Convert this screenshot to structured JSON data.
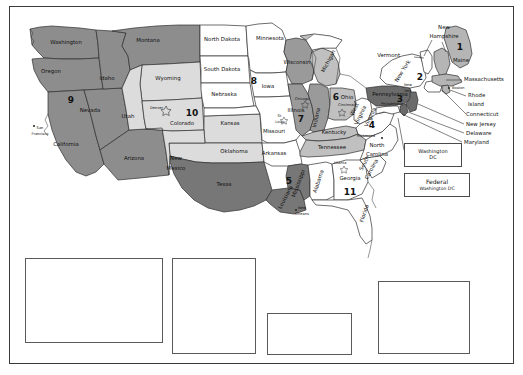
{
  "map": {
    "title": "United States Federal Judicial Circuits",
    "colors": {
      "dark_gray": "#6e6e6e",
      "mid_gray": "#a0a0a0",
      "light_gray": "#c9c9c9",
      "pale_gray": "#e2e2e2",
      "white": "#ffffff",
      "outline": "#2f2f2f",
      "frame": "#3a3a3a"
    },
    "circuit_numbers": [
      {
        "id": "circuit-1",
        "label": "1",
        "x": 460,
        "y": 47,
        "region": "Maine / Massachusetts / New Hampshire / Rhode Island / Puerto Rico"
      },
      {
        "id": "circuit-2",
        "label": "2",
        "x": 420,
        "y": 77,
        "region": "New York / Connecticut / Vermont"
      },
      {
        "id": "circuit-3",
        "label": "3",
        "x": 396,
        "y": 104,
        "region": "Pennsylvania / New Jersey / Delaware / Virgin Islands"
      },
      {
        "id": "circuit-4",
        "label": "4",
        "x": 371,
        "y": 126,
        "region": "Virginia / West Virginia / North Carolina / South Carolina / Maryland"
      },
      {
        "id": "circuit-5",
        "label": "5",
        "x": 277,
        "y": 184,
        "region": "Texas / Louisiana / Mississippi"
      },
      {
        "id": "circuit-6",
        "label": "6",
        "x": 331,
        "y": 98,
        "region": "Ohio / Michigan / Kentucky / Tennessee"
      },
      {
        "id": "circuit-7",
        "label": "7",
        "x": 297,
        "y": 120,
        "region": "Illinois / Indiana / Wisconsin"
      },
      {
        "id": "circuit-8",
        "label": "8",
        "x": 252,
        "y": 82,
        "region": "Minnesota / Iowa / Missouri / Arkansas / Nebraska / Dakotas"
      },
      {
        "id": "circuit-9",
        "label": "9",
        "x": 69,
        "y": 100,
        "region": "California / Nevada / Oregon / Washington / Idaho / Montana / Arizona / Alaska / Hawaii"
      },
      {
        "id": "circuit-10",
        "label": "10",
        "x": 190,
        "y": 113,
        "region": "Colorado / Wyoming / Utah / Kansas / Oklahoma / New Mexico"
      },
      {
        "id": "circuit-11",
        "label": "11",
        "x": 349,
        "y": 192,
        "region": "Georgia / Florida / Alabama"
      }
    ],
    "states": [
      {
        "name": "Washington",
        "x": 66,
        "y": 44
      },
      {
        "name": "Oregon",
        "x": 51,
        "y": 73
      },
      {
        "name": "Idaho",
        "x": 107,
        "y": 80
      },
      {
        "name": "Montana",
        "x": 148,
        "y": 42
      },
      {
        "name": "Wyoming",
        "x": 162,
        "y": 80
      },
      {
        "name": "Nevada",
        "x": 84,
        "y": 112
      },
      {
        "name": "Utah",
        "x": 128,
        "y": 118
      },
      {
        "name": "California",
        "x": 64,
        "y": 144
      },
      {
        "name": "Arizona",
        "x": 128,
        "y": 159
      },
      {
        "name": "New",
        "x": 176,
        "y": 160
      },
      {
        "name": "Mexico",
        "x": 176,
        "y": 170
      },
      {
        "name": "Colorado",
        "x": 188,
        "y": 125
      },
      {
        "name": "North Dakota",
        "x": 216,
        "y": 34
      },
      {
        "name": "South Dakota",
        "x": 216,
        "y": 70
      },
      {
        "name": "Nebraska",
        "x": 219,
        "y": 95
      },
      {
        "name": "Kansas",
        "x": 227,
        "y": 124
      },
      {
        "name": "Oklahoma",
        "x": 234,
        "y": 151
      },
      {
        "name": "Texas",
        "x": 224,
        "y": 185
      },
      {
        "name": "Minnesota",
        "x": 267,
        "y": 38
      },
      {
        "name": "Iowa",
        "x": 265,
        "y": 87
      },
      {
        "name": "Missouri",
        "x": 271,
        "y": 134
      },
      {
        "name": "Arkansas",
        "x": 272,
        "y": 154
      },
      {
        "name": "Wisconsin",
        "x": 294,
        "y": 62
      },
      {
        "name": "Illinois",
        "x": 294,
        "y": 110
      },
      {
        "name": "Indiana",
        "x": 318,
        "y": 115
      },
      {
        "name": "Ohio",
        "x": 343,
        "y": 98
      },
      {
        "name": "Michigan",
        "x": 328,
        "y": 62
      },
      {
        "name": "Kentucky",
        "x": 333,
        "y": 132
      },
      {
        "name": "Tennessee",
        "x": 331,
        "y": 147
      },
      {
        "name": "Mississippi",
        "x": 299,
        "y": 182
      },
      {
        "name": "Alabama",
        "x": 318,
        "y": 180
      },
      {
        "name": "Louisiana",
        "x": 285,
        "y": 194
      },
      {
        "name": "Georgia",
        "x": 349,
        "y": 178
      },
      {
        "name": "Florida",
        "x": 365,
        "y": 212
      },
      {
        "name": "South",
        "x": 363,
        "y": 163
      },
      {
        "name": "Carolina",
        "x": 363,
        "y": 171
      },
      {
        "name": "North",
        "x": 375,
        "y": 148
      },
      {
        "name": "Carolina",
        "x": 375,
        "y": 157
      },
      {
        "name": "Virginia",
        "x": 372,
        "y": 115
      },
      {
        "name": "West",
        "x": 356,
        "y": 110
      },
      {
        "name": "Virginia",
        "x": 356,
        "y": 117
      },
      {
        "name": "Pennsylvania",
        "x": 392,
        "y": 96
      },
      {
        "name": "New York",
        "x": 410,
        "y": 72
      },
      {
        "name": "Vermont",
        "x": 403,
        "y": 56
      },
      {
        "name": "New",
        "x": 448,
        "y": 28
      },
      {
        "name": "Hampshire",
        "x": 448,
        "y": 37
      },
      {
        "name": "Maine",
        "x": 463,
        "y": 62
      },
      {
        "name": "Massachusetts",
        "x": 478,
        "y": 78
      },
      {
        "name": "Rhode",
        "x": 477,
        "y": 95
      },
      {
        "name": "Island",
        "x": 477,
        "y": 104
      },
      {
        "name": "Connecticut",
        "x": 476,
        "y": 114
      },
      {
        "name": "New Jersey",
        "x": 474,
        "y": 124
      },
      {
        "name": "Delaware",
        "x": 473,
        "y": 133
      },
      {
        "name": "Maryland",
        "x": 471,
        "y": 142
      }
    ],
    "cities": [
      {
        "name": "Denver",
        "x": 165,
        "y": 108
      },
      {
        "name": "San",
        "x": 34,
        "y": 128
      },
      {
        "name": "Francisco",
        "x": 34,
        "y": 134
      },
      {
        "name": "St.",
        "x": 278,
        "y": 116
      },
      {
        "name": "Louis",
        "x": 278,
        "y": 122
      },
      {
        "name": "Chicago",
        "x": 300,
        "y": 99
      },
      {
        "name": "Cincinnati",
        "x": 344,
        "y": 105
      },
      {
        "name": "Richmond",
        "x": 364,
        "y": 136
      },
      {
        "name": "Atlanta",
        "x": 337,
        "y": 163
      },
      {
        "name": "New",
        "x": 299,
        "y": 208
      },
      {
        "name": "Orleans",
        "x": 299,
        "y": 214
      },
      {
        "name": "New",
        "x": 406,
        "y": 85
      },
      {
        "name": "York",
        "x": 406,
        "y": 91
      },
      {
        "name": "Boston",
        "x": 451,
        "y": 88
      },
      {
        "name": "Philadelphia",
        "x": 392,
        "y": 104
      }
    ],
    "dc_boxes": [
      {
        "id": "washington-dc-box",
        "line1": "Washington",
        "line2": "DC"
      },
      {
        "id": "federal-washington-dc-box",
        "line1": "Federal",
        "line2": "Washington DC"
      }
    ],
    "insets": [
      {
        "id": "alaska",
        "labels": [
          {
            "text": "9",
            "kind": "number"
          },
          {
            "text": "Alaska",
            "kind": "place"
          }
        ]
      },
      {
        "id": "pacific",
        "labels": [
          {
            "text": "Hawaii",
            "kind": "place"
          },
          {
            "text": "9",
            "kind": "number"
          },
          {
            "text": "Northern",
            "kind": "place"
          },
          {
            "text": "Mariana",
            "kind": "place"
          },
          {
            "text": "Islands",
            "kind": "place"
          },
          {
            "text": "Guam",
            "kind": "place"
          }
        ]
      },
      {
        "id": "puerto-rico",
        "labels": [
          {
            "text": "Puerto Rico",
            "kind": "place"
          },
          {
            "text": "1",
            "kind": "number"
          }
        ]
      },
      {
        "id": "virgin-islands",
        "labels": [
          {
            "text": "Virgin",
            "kind": "place"
          },
          {
            "text": "Islands",
            "kind": "place"
          },
          {
            "text": "3",
            "kind": "number"
          }
        ]
      }
    ]
  }
}
